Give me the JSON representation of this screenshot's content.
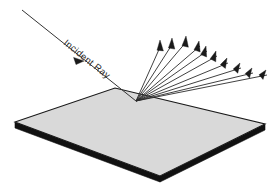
{
  "diagram": {
    "background_color": "#ffffff",
    "line_color": "#2b2b2b",
    "surface_fill": "#d9d9d9",
    "surface_edge_color": "#111111",
    "labels": {
      "incident_ray": "Incident Ray"
    },
    "surface": {
      "name": "reflecting-plane",
      "shape": "parallelogram",
      "top_face_points": "15,122 115,88 265,124 160,176",
      "thickness_px": 6,
      "corners": {
        "left": [
          15,
          122
        ],
        "top": [
          115,
          88
        ],
        "right": [
          265,
          124
        ],
        "bottom": [
          160,
          176
        ]
      }
    },
    "incident_ray": {
      "name": "incident-ray",
      "start": [
        22,
        10
      ],
      "end": [
        136,
        101
      ],
      "arrow_at": [
        79,
        56
      ],
      "angle_deg": 38.6
    },
    "reflection_point": [
      136,
      101
    ],
    "reflected_rays": [
      {
        "id": 1,
        "tip": [
          160,
          42
        ],
        "angle_deg": 68
      },
      {
        "id": 2,
        "tip": [
          172,
          40
        ],
        "angle_deg": 64
      },
      {
        "id": 3,
        "tip": [
          186,
          38
        ],
        "angle_deg": 60
      },
      {
        "id": 4,
        "tip": [
          199,
          43
        ],
        "angle_deg": 52
      },
      {
        "id": 5,
        "tip": [
          206,
          48
        ],
        "angle_deg": 46
      },
      {
        "id": 6,
        "tip": [
          216,
          53
        ],
        "angle_deg": 41
      },
      {
        "id": 7,
        "tip": [
          227,
          60
        ],
        "angle_deg": 34
      },
      {
        "id": 8,
        "tip": [
          240,
          65
        ],
        "angle_deg": 29
      },
      {
        "id": 9,
        "tip": [
          252,
          70
        ],
        "angle_deg": 25
      },
      {
        "id": 10,
        "tip": [
          266,
          72
        ],
        "angle_deg": 22
      }
    ],
    "ray_count": 10
  }
}
